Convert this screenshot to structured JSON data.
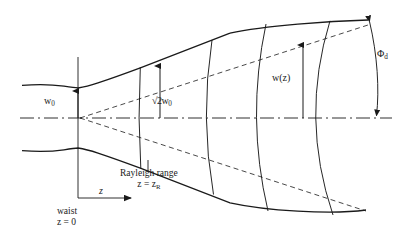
{
  "figure": {
    "type": "optics-diagram",
    "width": 414,
    "height": 242,
    "background_color": "#ffffff",
    "line_color": "#1a1a1a"
  },
  "labels": {
    "waist_radius": "w",
    "waist_radius_sub": "0",
    "rayleigh_radius_prefix": "√2w",
    "rayleigh_radius_sub": "0",
    "beam_radius": "w(z)",
    "divergence_angle": "Φ",
    "divergence_angle_sub": "d",
    "rayleigh_range_line1": "Rayleigh range",
    "rayleigh_range_line2_prefix": "z = z",
    "rayleigh_range_line2_sub": "R",
    "waist_line1": "waist",
    "waist_line2": "z = 0",
    "axis_z": "z"
  },
  "geometry": {
    "optical_axis_y": 118,
    "waist_x": 78,
    "waist_half_width": 30,
    "divergence_slope": 0.32,
    "rayleigh_x": 141,
    "envelope_start_x": 22,
    "envelope_end_x": 368,
    "wavefront_x_positions": [
      141,
      212,
      265,
      318
    ],
    "wavefront_sagitta": [
      3,
      12,
      20,
      30
    ],
    "vertical_axis_x": 78,
    "vertical_axis_top_y": 57,
    "vertical_axis_bottom_y": 198,
    "z_arrow_y": 198,
    "z_arrow_end_x": 137,
    "wz_arrow_x": 303,
    "sqrt2w0_arrow_x": 160,
    "phid_arc_x": 378
  },
  "colors": {
    "stroke": "#1a1a1a",
    "background": "#ffffff"
  }
}
